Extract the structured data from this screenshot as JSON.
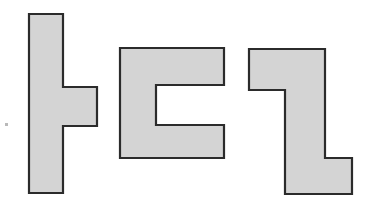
{
  "figure": {
    "title": "",
    "caption": "",
    "background_color": "#ffffff",
    "fill_color": "#d4d4d4",
    "stroke_color": "#2b2b2b",
    "stroke_width": 2.2,
    "canvas": {
      "width": 376,
      "height": 209
    },
    "shape_count": 3,
    "shapes": [
      {
        "id": "shape-1",
        "name": "tall-bar-with-right-tab",
        "label": "",
        "fill": "#d4d4d4",
        "stroke": "#2b2b2b",
        "bbox": {
          "x": 29,
          "y": 14,
          "width": 69,
          "height": 179
        },
        "points": "29,14 63,14 63,87 97,87 97,126 63,126 63,193 29,193"
      },
      {
        "id": "shape-2",
        "name": "t-shape-with-right-notch",
        "label": "",
        "fill": "#d4d4d4",
        "stroke": "#2b2b2b",
        "bbox": {
          "x": 120,
          "y": 48,
          "width": 104,
          "height": 110
        },
        "points": "120,48 224,48 224,85 156,85 156,125 224,125 224,158 120,158"
      },
      {
        "id": "shape-3",
        "name": "z-shape-step",
        "label": "",
        "fill": "#d4d4d4",
        "stroke": "#2b2b2b",
        "bbox": {
          "x": 249,
          "y": 49,
          "width": 103,
          "height": 145
        },
        "points": "249,49 325,49 325,158 352,158 352,194 285,194 285,90 249,90"
      }
    ],
    "specks": [
      {
        "name": "dust-speck-left",
        "x": 5,
        "y": 123,
        "width": 3,
        "height": 3
      }
    ]
  }
}
